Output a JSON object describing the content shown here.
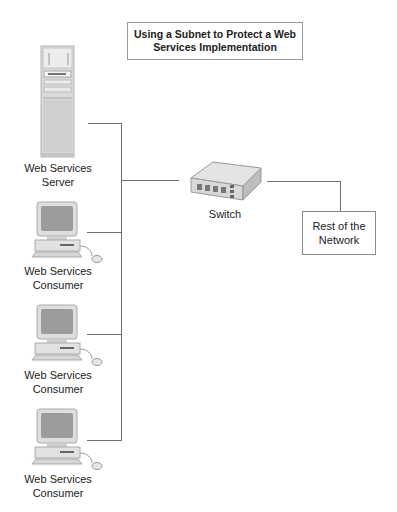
{
  "title": {
    "line1": "Using a Subnet to Protect a Web",
    "line2": "Services Implementation"
  },
  "nodes": {
    "server": {
      "icon": "server-tower-icon",
      "line1": "Web Services",
      "line2": "Server"
    },
    "consumers": [
      {
        "icon": "desktop-computer-icon",
        "line1": "Web Services",
        "line2": "Consumer"
      },
      {
        "icon": "desktop-computer-icon",
        "line1": "Web Services",
        "line2": "Consumer"
      },
      {
        "icon": "desktop-computer-icon",
        "line1": "Web Services",
        "line2": "Consumer"
      }
    ],
    "switch": {
      "icon": "network-switch-icon",
      "label": "Switch"
    },
    "network": {
      "line1": "Rest of the",
      "line2": "Network"
    }
  },
  "colors": {
    "line": "#6f6f6f",
    "box_border": "#9a9a9a"
  }
}
